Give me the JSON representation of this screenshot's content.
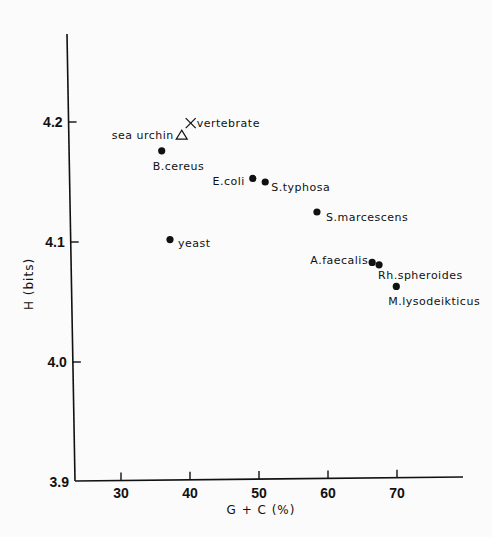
{
  "chart_data": {
    "type": "scatter",
    "title": "",
    "xlabel": "G + C (%)",
    "ylabel": "H (bits)",
    "xlim": [
      25,
      80
    ],
    "ylim": [
      3.9,
      4.28
    ],
    "xticks": [
      30,
      40,
      50,
      60,
      70
    ],
    "yticks": [
      3.9,
      4.0,
      4.1,
      4.2
    ],
    "xtick_labels": [
      "30",
      "40",
      "50",
      "60",
      "70"
    ],
    "ytick_labels": [
      "3.9",
      "4.0",
      "4.1",
      "4.2"
    ],
    "grid": false,
    "legend": null,
    "points": [
      {
        "label": "vertebrate",
        "x": 40.1,
        "y": 4.199,
        "marker": "x"
      },
      {
        "label": "sea urchin",
        "x": 38.8,
        "y": 4.189,
        "marker": "triangle"
      },
      {
        "label": "B.cereus",
        "x": 35.9,
        "y": 4.176,
        "marker": "dot"
      },
      {
        "label": "E.coli",
        "x": 49.1,
        "y": 4.153,
        "marker": "dot"
      },
      {
        "label": "S.typhosa",
        "x": 50.9,
        "y": 4.15,
        "marker": "dot"
      },
      {
        "label": "S.marcescens",
        "x": 58.4,
        "y": 4.125,
        "marker": "dot"
      },
      {
        "label": "yeast",
        "x": 37.1,
        "y": 4.102,
        "marker": "dot"
      },
      {
        "label": "A.faecalis",
        "x": 66.4,
        "y": 4.083,
        "marker": "dot"
      },
      {
        "label": "Rh.spheroides",
        "x": 67.4,
        "y": 4.081,
        "marker": "dot"
      },
      {
        "label": "M.lysodeikticus",
        "x": 69.9,
        "y": 4.063,
        "marker": "dot"
      }
    ]
  },
  "labels": {
    "xlabel": "G + C (%)",
    "ylabel": "H (bits)"
  }
}
